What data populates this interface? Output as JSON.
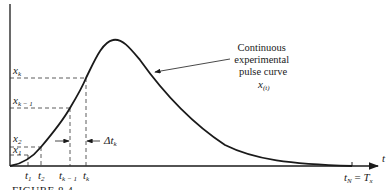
{
  "figure": {
    "caption": "FIGURE 8.4",
    "annotation": {
      "lines": [
        "Continuous",
        "experimental",
        "pulse curve"
      ],
      "symbol": "x",
      "symbol_sub": "(t)"
    },
    "axes": {
      "x_label": "t",
      "y_ticks": [
        {
          "base": "x",
          "sub": "k"
        },
        {
          "base": "x",
          "sub": "k − 1"
        },
        {
          "base": "x",
          "sub": "2"
        },
        {
          "base": "x",
          "sub": "1"
        }
      ],
      "x_ticks": [
        {
          "base": "t",
          "sub": "1"
        },
        {
          "base": "t",
          "sub": "2"
        },
        {
          "base": "t",
          "sub": "k − 1"
        },
        {
          "base": "t",
          "sub": "k"
        }
      ],
      "end_tick": {
        "base": "t",
        "sub": "N",
        "eq": " = ",
        "rhs_base": "T",
        "rhs_sub": "x"
      }
    },
    "interval": {
      "label_base": "Δt",
      "label_sub": "k"
    },
    "colors": {
      "ink": "#1a1a1a",
      "background": "#ffffff"
    }
  }
}
